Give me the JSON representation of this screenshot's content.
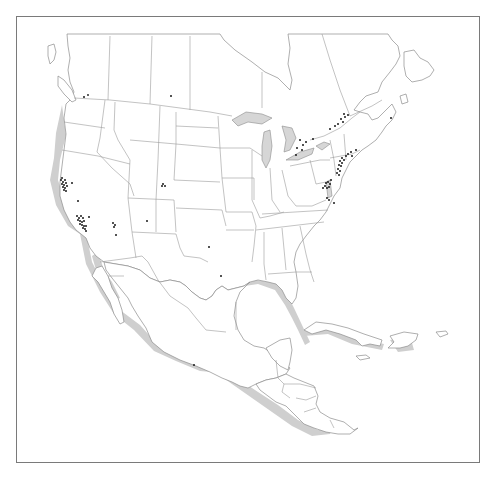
{
  "map": {
    "region": "North America",
    "style": {
      "frame_color": "#7a7a7a",
      "land_fill": "#ffffff",
      "outline_color": "#8c8c8c",
      "shadow_color": "#cfcfcf",
      "marker_color": "#1a1a1a"
    },
    "regions_shown": [
      "Canada (southern)",
      "United States",
      "Mexico",
      "Central America",
      "Caribbean (Cuba, Hispaniola, Jamaica, Puerto Rico)"
    ],
    "marker_clusters": [
      {
        "area": "San Francisco Bay, California",
        "approx_count": 14
      },
      {
        "area": "Los Angeles / Southern California",
        "approx_count": 20
      },
      {
        "area": "Central California",
        "approx_count": 1
      },
      {
        "area": "Northern California (Sacramento)",
        "approx_count": 1
      },
      {
        "area": "Arizona (Phoenix)",
        "approx_count": 4
      },
      {
        "area": "Seattle / Vancouver",
        "approx_count": 2
      },
      {
        "area": "Alberta",
        "approx_count": 1
      },
      {
        "area": "Colorado (Denver/Boulder)",
        "approx_count": 3
      },
      {
        "area": "New Mexico",
        "approx_count": 1
      },
      {
        "area": "Texas (Dallas/Austin)",
        "approx_count": 1
      },
      {
        "area": "Texas (Houston)",
        "approx_count": 1
      },
      {
        "area": "Mexico City",
        "approx_count": 1
      },
      {
        "area": "Southern Ontario (Toronto)",
        "approx_count": 7
      },
      {
        "area": "Quebec / Ottawa corridor",
        "approx_count": 8
      },
      {
        "area": "Nova Scotia",
        "approx_count": 1
      },
      {
        "area": "Boston / New England",
        "approx_count": 5
      },
      {
        "area": "New York / New Jersey",
        "approx_count": 10
      },
      {
        "area": "Washington DC / Maryland",
        "approx_count": 8
      },
      {
        "area": "Virginia / North Carolina",
        "approx_count": 3
      }
    ]
  }
}
